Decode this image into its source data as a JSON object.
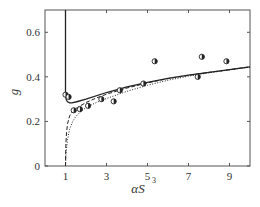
{
  "chart_data": {
    "type": "line",
    "title": "",
    "xlabel": "αS",
    "xlabel_superscript": "3",
    "ylabel": "g",
    "xlim": [
      0,
      10
    ],
    "ylim": [
      0,
      0.7
    ],
    "xticks": [
      1,
      3,
      5,
      7,
      9
    ],
    "xtick_labels": [
      "1",
      "3",
      "5",
      "7",
      "9"
    ],
    "yticks": [
      0,
      0.2,
      0.4,
      0.6
    ],
    "ytick_labels": [
      "0",
      "0.2",
      "0.4",
      "0.6"
    ],
    "grid": false,
    "legend": null,
    "series": [
      {
        "name": "solid",
        "style": "solid",
        "x": [
          1.0,
          1.0,
          1.02,
          1.05,
          1.1,
          1.2,
          1.3,
          1.5,
          2,
          3,
          4,
          5,
          6,
          7,
          8,
          9,
          10
        ],
        "y": [
          0.7,
          0.32,
          0.305,
          0.295,
          0.288,
          0.283,
          0.283,
          0.287,
          0.3,
          0.33,
          0.355,
          0.375,
          0.393,
          0.408,
          0.42,
          0.432,
          0.445
        ]
      },
      {
        "name": "dashed",
        "style": "dashed",
        "x": [
          1.0,
          1.02,
          1.05,
          1.1,
          1.2,
          1.35,
          1.5,
          2,
          2.5,
          3,
          4,
          5,
          6,
          7,
          8,
          9,
          10
        ],
        "y": [
          0.0,
          0.1,
          0.15,
          0.19,
          0.225,
          0.245,
          0.258,
          0.285,
          0.305,
          0.322,
          0.35,
          0.373,
          0.392,
          0.407,
          0.42,
          0.432,
          0.445
        ]
      },
      {
        "name": "dotted",
        "style": "dotted",
        "x": [
          1.0,
          1.03,
          1.1,
          1.2,
          1.35,
          1.5,
          1.75,
          2,
          2.5,
          3,
          4,
          5,
          6,
          7,
          8,
          9,
          10
        ],
        "y": [
          0.0,
          0.06,
          0.12,
          0.165,
          0.2,
          0.222,
          0.245,
          0.262,
          0.285,
          0.303,
          0.335,
          0.362,
          0.385,
          0.403,
          0.418,
          0.431,
          0.444
        ]
      },
      {
        "name": "data points",
        "style": "markers",
        "x": [
          1.0,
          1.15,
          1.4,
          1.7,
          2.1,
          2.75,
          3.35,
          3.65,
          4.8,
          5.35,
          7.45,
          7.65,
          8.85
        ],
        "y": [
          0.32,
          0.31,
          0.25,
          0.255,
          0.27,
          0.3,
          0.29,
          0.34,
          0.37,
          0.47,
          0.4,
          0.49,
          0.47
        ]
      }
    ]
  },
  "colors": {
    "axis": "#555555",
    "line": "#222222",
    "marker_edge": "#222222",
    "marker_fill": "#ffffff"
  }
}
